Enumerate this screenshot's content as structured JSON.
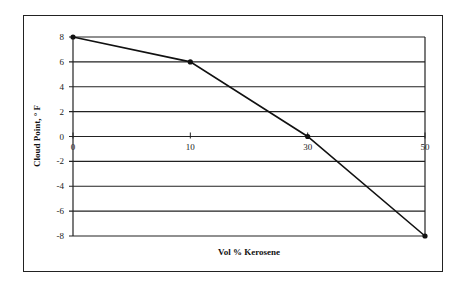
{
  "chart_data": {
    "type": "line",
    "title": "",
    "xlabel": "Vol % Kerosene",
    "ylabel": "Cloud Point, ° F",
    "categories": [
      "0",
      "10",
      "30",
      "50"
    ],
    "x": [
      0,
      10,
      30,
      50
    ],
    "series": [
      {
        "name": "Cloud Point",
        "values": [
          8,
          6,
          0,
          -8
        ]
      }
    ],
    "yticks": [
      "8",
      "6",
      "4",
      "2",
      "0",
      "-2",
      "-4",
      "-6",
      "-8"
    ],
    "ylim": [
      -8,
      8
    ],
    "grid": "horizontal",
    "legend": "none",
    "colors": {
      "line": "#111111",
      "grid": "#222222",
      "frame": "#222222"
    }
  }
}
